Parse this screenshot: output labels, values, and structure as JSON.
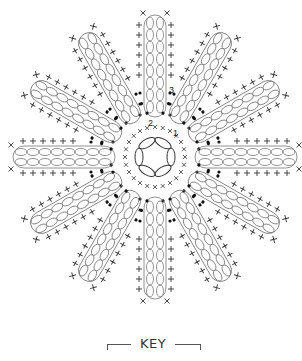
{
  "diagram": {
    "type": "crochet-flower-chart",
    "center": {
      "x": 155,
      "y": 157
    },
    "petal_count": 12,
    "ring_radius": 20,
    "colors": {
      "ink": "#333333",
      "chain": "#777777",
      "dot": "#111111",
      "background": "#ffffff"
    },
    "round_labels": [
      {
        "text": "1",
        "x": 173,
        "y": 136
      },
      {
        "text": "2",
        "x": 150,
        "y": 128
      },
      {
        "text": "3",
        "x": 169,
        "y": 93
      }
    ]
  },
  "key": {
    "title": "KEY"
  }
}
